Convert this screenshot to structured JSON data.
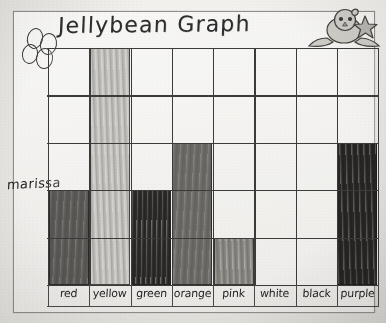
{
  "title": "Jellybean Graph",
  "student_name": "marissa",
  "decorations": {
    "chick_sticker": "chick-with-star-sticker",
    "doodle_circles": "circle-doodles"
  },
  "chart_data": {
    "type": "bar",
    "title": "Jellybean Graph",
    "xlabel": "",
    "ylabel": "",
    "ylim": [
      0,
      5
    ],
    "grid": true,
    "legend": "none",
    "categories": [
      "red",
      "yellow",
      "green",
      "orange",
      "pink",
      "white",
      "black",
      "purple"
    ],
    "values": [
      2,
      5,
      2,
      3,
      1,
      0,
      0,
      3
    ],
    "colors": [
      "#5e5c59",
      "#c9c7c2",
      "#2e2d2b",
      "#6f6d69",
      "#8d8b86",
      "#f0efec",
      "#f0efec",
      "#292826"
    ],
    "rows": 5,
    "columns": 8
  }
}
